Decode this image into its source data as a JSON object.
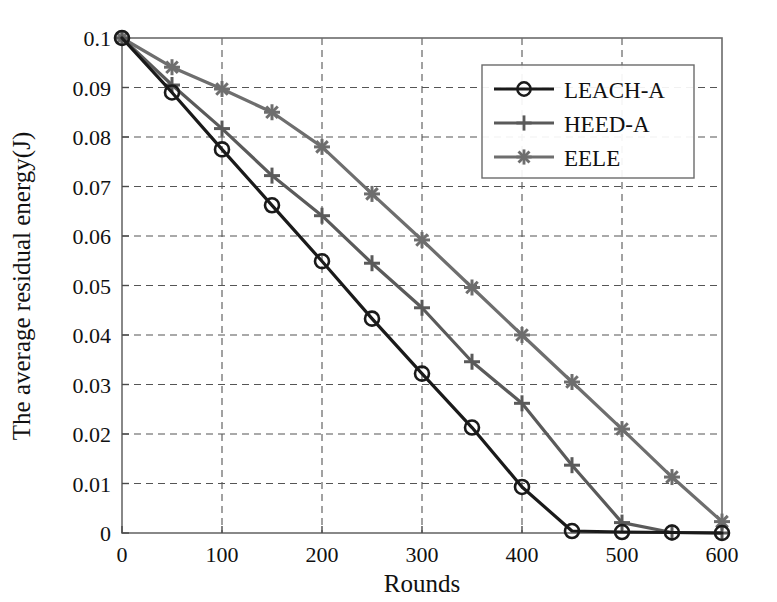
{
  "chart_data": {
    "type": "line",
    "title": "",
    "xlabel": "Rounds",
    "ylabel": "The average residual energy(J)",
    "xlim": [
      0,
      600
    ],
    "ylim": [
      0,
      0.1
    ],
    "xticks": [
      0,
      100,
      200,
      300,
      400,
      500,
      600
    ],
    "xtick_labels": [
      "0",
      "100",
      "200",
      "300",
      "400",
      "500",
      "600"
    ],
    "yticks": [
      0,
      0.01,
      0.02,
      0.03,
      0.04,
      0.05,
      0.06,
      0.07,
      0.08,
      0.09,
      0.1
    ],
    "ytick_labels": [
      "0",
      "0.01",
      "0.02",
      "0.03",
      "0.04",
      "0.05",
      "0.06",
      "0.07",
      "0.08",
      "0.09",
      "0.1"
    ],
    "grid": true,
    "grid_style": "dashed",
    "legend_position": "upper right",
    "x": [
      0,
      50,
      100,
      150,
      200,
      250,
      300,
      350,
      400,
      450,
      500,
      550,
      600
    ],
    "series": [
      {
        "name": "LEACH-A",
        "color": "#1a1a1a",
        "marker": "circle",
        "values": [
          0.1,
          0.089,
          0.0775,
          0.0662,
          0.0549,
          0.0433,
          0.0322,
          0.0213,
          0.0093,
          0.0004,
          0.0002,
          0.0001,
          0.0
        ]
      },
      {
        "name": "HEED-A",
        "color": "#5a5a5a",
        "marker": "plus",
        "values": [
          0.1,
          0.0905,
          0.0817,
          0.0722,
          0.0641,
          0.0545,
          0.0455,
          0.0346,
          0.0262,
          0.0137,
          0.0021,
          0.0001,
          0.0
        ]
      },
      {
        "name": "EELE",
        "color": "#6e6e6e",
        "marker": "asterisk",
        "values": [
          0.1,
          0.0941,
          0.0897,
          0.085,
          0.078,
          0.0685,
          0.0592,
          0.0496,
          0.04,
          0.0305,
          0.021,
          0.0113,
          0.0023
        ]
      }
    ]
  },
  "legend": {
    "entries": [
      {
        "label": "LEACH-A"
      },
      {
        "label": "HEED-A"
      },
      {
        "label": "EELE"
      }
    ]
  }
}
